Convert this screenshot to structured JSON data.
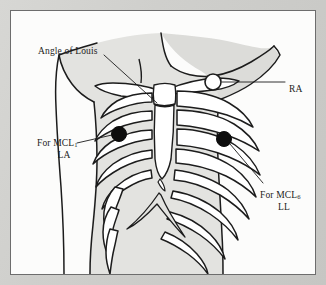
{
  "colors": {
    "mount": "#c9c9c7",
    "page": "#fcfcfb",
    "frame_line": "#6d6d6d",
    "skin_fill": "#e3e3e0",
    "bone_fill": "#ffffff",
    "ink": "#1c1c1c",
    "electrode_filled": "#0d0d0d",
    "electrode_open": "#ffffff"
  },
  "labels": {
    "angle_of_louis": {
      "text": "Angle of Louis",
      "leader": "to sternal angle"
    },
    "ra": {
      "text": "RA",
      "leader": "to right clavicle electrode"
    },
    "mcl1": {
      "line1": "For MCL",
      "sub1": "1",
      "line2": "LA",
      "leader": "to left 4th intercostal electrode"
    },
    "mcl6": {
      "line1": "For MCL",
      "sub1": "6",
      "line2": "LL",
      "leader": "to left midaxillary electrode"
    }
  },
  "electrodes": [
    {
      "name": "RA",
      "style": "open-circle",
      "x": 202,
      "y": 71,
      "r": 8
    },
    {
      "name": "LA",
      "style": "filled-circle",
      "x": 108,
      "y": 123,
      "r": 7.5
    },
    {
      "name": "LL",
      "style": "filled-circle",
      "x": 213,
      "y": 128,
      "r": 7.5
    }
  ]
}
